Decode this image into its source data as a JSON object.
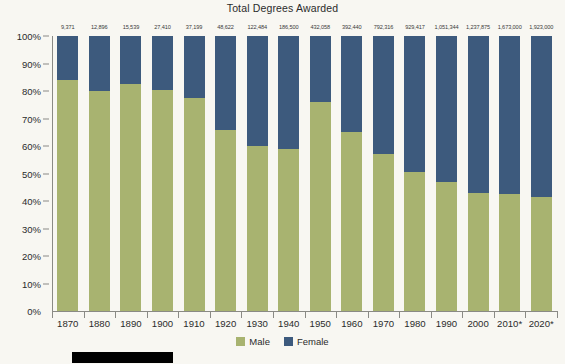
{
  "chart_data": {
    "type": "bar",
    "stacked": true,
    "stack_mode": "percent",
    "title": "Total Degrees Awarded",
    "xlabel": "",
    "ylabel": "",
    "ylim": [
      0,
      100
    ],
    "ytick_labels": [
      "0%",
      "10%",
      "20%",
      "30%",
      "40%",
      "50%",
      "60%",
      "70%",
      "80%",
      "90%",
      "100%"
    ],
    "ytick_values": [
      0,
      10,
      20,
      30,
      40,
      50,
      60,
      70,
      80,
      90,
      100
    ],
    "grid": false,
    "legend_position": "bottom",
    "categories": [
      "1870",
      "1880",
      "1890",
      "1900",
      "1910",
      "1920",
      "1930",
      "1940",
      "1950",
      "1960",
      "1970",
      "1980",
      "1990",
      "2000",
      "2010*",
      "2020*"
    ],
    "series": [
      {
        "name": "Male",
        "color": "#a8b370",
        "values": [
          84.0,
          80.0,
          82.5,
          80.5,
          77.5,
          66.0,
          60.0,
          59.0,
          76.0,
          65.0,
          57.0,
          50.5,
          47.0,
          43.0,
          42.5,
          41.5
        ]
      },
      {
        "name": "Female",
        "color": "#3d5a7d",
        "values": [
          16.0,
          20.0,
          17.5,
          19.5,
          22.5,
          34.0,
          40.0,
          41.0,
          24.0,
          35.0,
          43.0,
          49.5,
          53.0,
          57.0,
          57.5,
          58.5
        ]
      }
    ],
    "point_labels": [
      "9,371",
      "12,896",
      "15,539",
      "27,410",
      "37,199",
      "48,622",
      "122,484",
      "186,500",
      "432,058",
      "392,440",
      "792,316",
      "929,417",
      "1,051,344",
      "1,237,875",
      "1,673,000",
      "1,923,000"
    ],
    "annotations": []
  },
  "legend": {
    "items": [
      {
        "label": "Male",
        "color": "#a8b370"
      },
      {
        "label": "Female",
        "color": "#3d5a7d"
      }
    ]
  },
  "colors": {
    "background": "#f8f7f2",
    "male": "#a8b370",
    "female": "#3d5a7d",
    "axis": "#8a8a85",
    "text": "#2b2b2b",
    "footer_bar": "#000000"
  }
}
